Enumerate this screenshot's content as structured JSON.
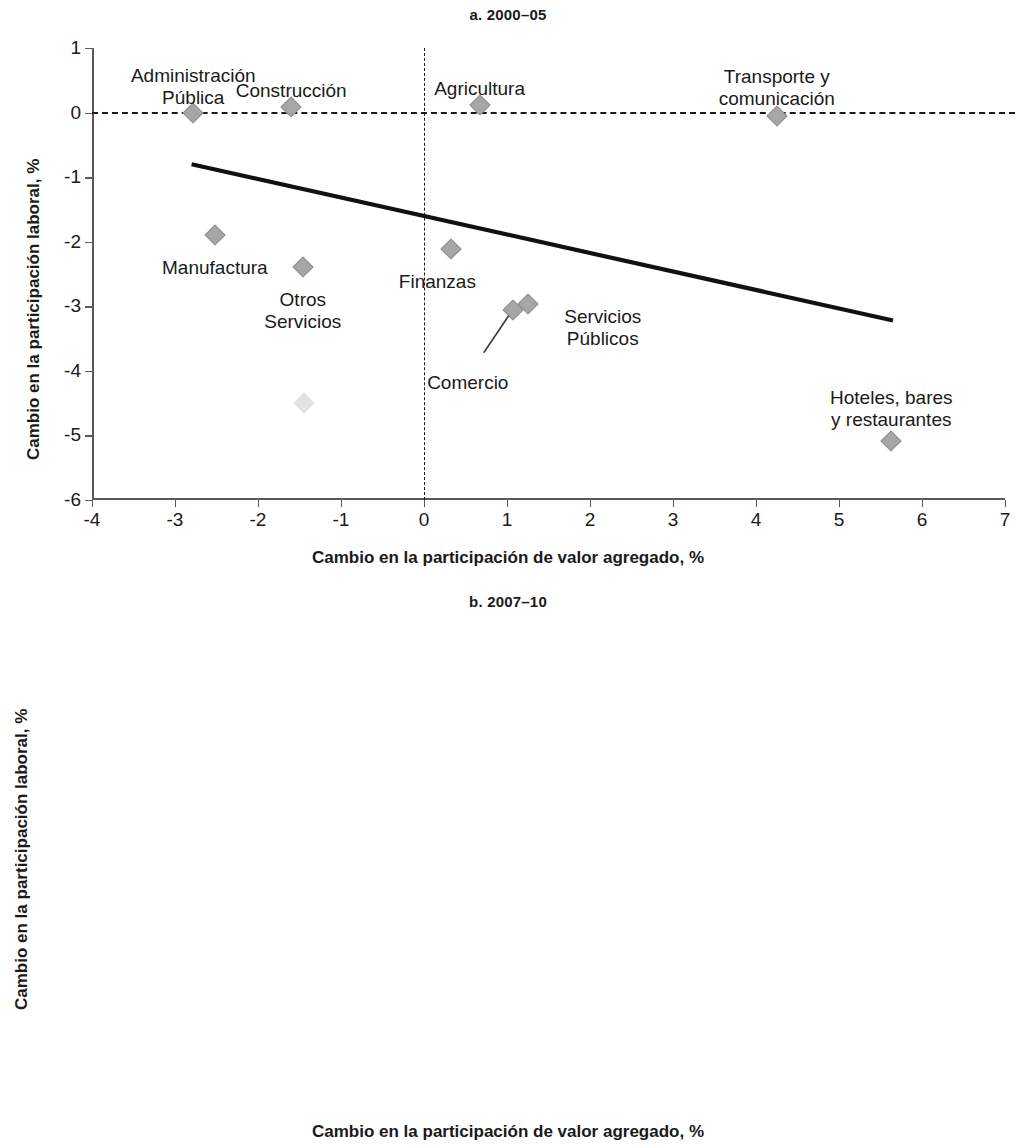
{
  "figure": {
    "shared_xlabel": "Cambio en la participación de valor agregado, %",
    "shared_ylabel": "Cambio en la participación laboral, %"
  },
  "panel_a": {
    "title": "a. 2000–05",
    "xlabel": "Cambio en la participación de valor agregado, %",
    "ylabel": "Cambio en la participación laboral, %",
    "xticks": [
      "-4",
      "-3",
      "-2",
      "-1",
      "0",
      "1",
      "2",
      "3",
      "4",
      "5",
      "6",
      "7"
    ],
    "yticks": [
      "1",
      "0",
      "-1",
      "-2",
      "-3",
      "-4",
      "-5",
      "-6"
    ],
    "labels": {
      "administracion": "Administración\nPública",
      "construccion": "Construcción",
      "agricultura": "Agricultura",
      "transporte": "Transporte y\ncomunicación",
      "manufactura": "Manufactura",
      "otros": "Otros\nServicios",
      "finanzas": "Finanzas",
      "comercio": "Comercio",
      "serv_publicos": "Servicios\nPúblicos",
      "hoteles": "Hoteles, bares\ny restaurantes"
    }
  },
  "panel_b": {
    "title": "b. 2007–10",
    "xlabel": "Cambio en la participación de valor agregado, %",
    "ylabel": "Cambio en la participación laboral, %",
    "xticks": [
      "-6",
      "-4",
      "-2",
      "0",
      "2",
      "4",
      "6"
    ],
    "yticks": [
      "10",
      "8",
      "6",
      "4",
      "2",
      "0",
      "-2",
      "-4",
      "-6"
    ],
    "labels": {
      "serv_publicos": "Servicios Públicos",
      "hoteles": "Hoteles, bares\ny restaurantes",
      "finanzas": "Finanzas",
      "transporte": "Transporte y\ncomunicación",
      "administracion": "Administración\nPública",
      "comercio": "Comercio",
      "otros": "Otros Servicios",
      "agricultura": "Agricultura",
      "manufactura": "Manufactura",
      "construccion": "Construcción"
    }
  },
  "chart_data": [
    {
      "type": "scatter",
      "panel": "a",
      "title": "a. 2000–05",
      "xlabel": "Cambio en la participación de valor agregado, %",
      "ylabel": "Cambio en la participación laboral, %",
      "xlim": [
        -4,
        7
      ],
      "ylim": [
        -6,
        1
      ],
      "xticks": [
        -4,
        -3,
        -2,
        -1,
        0,
        1,
        2,
        3,
        4,
        5,
        6,
        7
      ],
      "yticks": [
        1,
        0,
        -1,
        -2,
        -3,
        -4,
        -5,
        -6
      ],
      "grid": false,
      "legend": "none",
      "reference_lines": [
        {
          "type": "horizontal",
          "value": 0,
          "style": "dashed"
        },
        {
          "type": "vertical",
          "value": 0,
          "style": "dashed"
        }
      ],
      "trendline": {
        "x": [
          -2.8,
          5.65
        ],
        "y": [
          -0.8,
          -3.22
        ],
        "style": "solid"
      },
      "points": [
        {
          "label": "Administración Pública",
          "x": -2.78,
          "y": 0.0
        },
        {
          "label": "Construcción",
          "x": -1.6,
          "y": 0.08
        },
        {
          "label": "Agricultura",
          "x": 0.67,
          "y": 0.12
        },
        {
          "label": "Transporte y comunicación",
          "x": 4.25,
          "y": -0.06
        },
        {
          "label": "Manufactura",
          "x": -2.52,
          "y": -1.89
        },
        {
          "label": "Otros Servicios",
          "x": -1.46,
          "y": -2.39
        },
        {
          "label": "Finanzas",
          "x": 0.33,
          "y": -2.12
        },
        {
          "label": "Comercio",
          "x": 1.07,
          "y": -3.05
        },
        {
          "label": "Servicios Públicos",
          "x": 1.25,
          "y": -2.97
        },
        {
          "label": "Hoteles, bares y restaurantes",
          "x": 5.63,
          "y": -5.09
        }
      ]
    },
    {
      "type": "scatter",
      "panel": "b",
      "title": "b. 2007–10",
      "xlabel": "Cambio en la participación de valor agregado, %",
      "ylabel": "Cambio en la participación laboral, %",
      "xlim": [
        -6,
        6
      ],
      "ylim": [
        -6,
        10
      ],
      "xticks": [
        -6,
        -4,
        -2,
        0,
        2,
        4,
        6
      ],
      "yticks": [
        10,
        8,
        6,
        4,
        2,
        0,
        -2,
        -4,
        -6
      ],
      "grid": false,
      "legend": "none",
      "reference_lines": [
        {
          "type": "horizontal",
          "value": 0,
          "style": "dashed"
        },
        {
          "type": "vertical",
          "value": 0,
          "style": "dashed"
        }
      ],
      "trendline": {
        "x": [
          -4.3,
          5.85
        ],
        "y": [
          2.3,
          -0.55
        ],
        "style": "solid"
      },
      "points": [
        {
          "label": "Servicios Públicos",
          "x": -3.52,
          "y": 7.48
        },
        {
          "label": "Hoteles, bares y restaurantes",
          "x": -3.0,
          "y": 5.9
        },
        {
          "label": "Finanzas",
          "x": -0.25,
          "y": 2.75
        },
        {
          "label": "Comercio",
          "x": 2.9,
          "y": 1.18
        },
        {
          "label": "Transporte y comunicación",
          "x": 3.55,
          "y": 0.5
        },
        {
          "label": "Administración Pública",
          "x": 5.75,
          "y": 1.53
        },
        {
          "label": "Otros Servicios",
          "x": 2.85,
          "y": -0.42
        },
        {
          "label": "Agricultura",
          "x": -3.0,
          "y": -1.28
        },
        {
          "label": "Manufactura",
          "x": -2.5,
          "y": -2.68
        },
        {
          "label": "Construcción",
          "x": -0.15,
          "y": -4.5
        }
      ]
    }
  ]
}
